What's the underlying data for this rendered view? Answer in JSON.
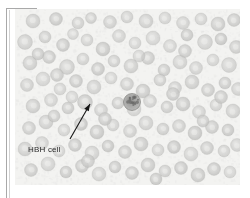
{
  "figure": {
    "kind": "light-microscopy-blood-smear",
    "caption_label": "HBH cell",
    "frame": {
      "bracket_color": "#a9a9a9",
      "secondary_rule_color": "#d2d2d2"
    },
    "plate": {
      "background_color": "#f1f1ef",
      "width_px": 225,
      "height_px": 176,
      "stain_tint": "#cfcfcf"
    },
    "annotation": {
      "label_text": "HBH cell",
      "label_color": "#2b2b2b",
      "arrow_color": "#151515",
      "arrow_tail_x": 55,
      "arrow_tail_y": 130,
      "arrow_head_x": 75,
      "arrow_head_y": 95
    },
    "cells": {
      "erythrocyte_fill": "#c6c6c4",
      "erythrocyte_edge": "#b0b0ae",
      "highlighted_cell_fill": "#9a9a98",
      "count_visible": 118
    }
  },
  "chart_data": {
    "type": "scatter",
    "title": "HBH cell",
    "xlabel": "",
    "ylabel": "",
    "note": "Peripheral blood smear micrograph; circular erythrocytes scattered on pale field. One cell indicated by arrow and labelled 'HBH cell'.",
    "legend": [
      "HBH cell"
    ],
    "series": [
      {
        "name": "erythrocytes",
        "points": [
          [
            18,
            12,
            7.0
          ],
          [
            41,
            10,
            6.5
          ],
          [
            63,
            14,
            6.0
          ],
          [
            76,
            9,
            5.5
          ],
          [
            95,
            13,
            6.5
          ],
          [
            112,
            8,
            6.0
          ],
          [
            131,
            12,
            7.0
          ],
          [
            150,
            9,
            6.0
          ],
          [
            168,
            14,
            6.5
          ],
          [
            186,
            10,
            6.0
          ],
          [
            203,
            15,
            7.0
          ],
          [
            219,
            11,
            6.5
          ],
          [
            10,
            33,
            7.5
          ],
          [
            30,
            28,
            6.0
          ],
          [
            48,
            36,
            6.5
          ],
          [
            58,
            25,
            5.5
          ],
          [
            72,
            31,
            6.0
          ],
          [
            88,
            40,
            7.0
          ],
          [
            104,
            27,
            6.5
          ],
          [
            120,
            34,
            6.0
          ],
          [
            138,
            29,
            7.0
          ],
          [
            155,
            37,
            6.5
          ],
          [
            172,
            26,
            6.0
          ],
          [
            190,
            33,
            7.5
          ],
          [
            206,
            30,
            6.0
          ],
          [
            221,
            38,
            6.5
          ],
          [
            15,
            54,
            7.0
          ],
          [
            34,
            48,
            6.5
          ],
          [
            52,
            58,
            7.5
          ],
          [
            68,
            50,
            6.0
          ],
          [
            83,
            60,
            6.5
          ],
          [
            99,
            52,
            6.0
          ],
          [
            116,
            57,
            7.0
          ],
          [
            133,
            49,
            6.5
          ],
          [
            149,
            61,
            6.0
          ],
          [
            165,
            53,
            7.0
          ],
          [
            181,
            59,
            6.5
          ],
          [
            198,
            51,
            6.0
          ],
          [
            214,
            56,
            7.5
          ],
          [
            12,
            76,
            6.5
          ],
          [
            28,
            70,
            7.0
          ],
          [
            45,
            80,
            6.0
          ],
          [
            61,
            72,
            6.5
          ],
          [
            79,
            78,
            7.0
          ],
          [
            96,
            69,
            6.0
          ],
          [
            112,
            75,
            6.5
          ],
          [
            128,
            82,
            7.0
          ],
          [
            145,
            71,
            6.0
          ],
          [
            160,
            79,
            6.5
          ],
          [
            177,
            73,
            7.0
          ],
          [
            193,
            81,
            6.5
          ],
          [
            210,
            74,
            6.0
          ],
          [
            223,
            80,
            6.5
          ],
          [
            18,
            97,
            7.0
          ],
          [
            36,
            91,
            6.5
          ],
          [
            53,
            99,
            6.0
          ],
          [
            70,
            93,
            7.5
          ],
          [
            86,
            101,
            6.5
          ],
          [
            103,
            94,
            6.0
          ],
          [
            119,
            100,
            7.0
          ],
          [
            135,
            92,
            6.5
          ],
          [
            152,
            98,
            6.0
          ],
          [
            168,
            95,
            7.0
          ],
          [
            184,
            103,
            6.5
          ],
          [
            201,
            96,
            6.0
          ],
          [
            218,
            102,
            7.0
          ],
          [
            14,
            119,
            6.5
          ],
          [
            31,
            113,
            7.0
          ],
          [
            49,
            121,
            6.0
          ],
          [
            66,
            115,
            6.5
          ],
          [
            82,
            123,
            7.0
          ],
          [
            98,
            116,
            6.0
          ],
          [
            115,
            122,
            6.5
          ],
          [
            131,
            114,
            7.0
          ],
          [
            148,
            120,
            6.0
          ],
          [
            164,
            117,
            6.5
          ],
          [
            180,
            124,
            7.0
          ],
          [
            197,
            118,
            6.5
          ],
          [
            213,
            121,
            6.0
          ],
          [
            10,
            140,
            7.0
          ],
          [
            27,
            134,
            6.5
          ],
          [
            44,
            142,
            6.0
          ],
          [
            60,
            136,
            6.5
          ],
          [
            77,
            144,
            7.0
          ],
          [
            93,
            137,
            6.0
          ],
          [
            110,
            143,
            6.5
          ],
          [
            126,
            135,
            7.0
          ],
          [
            143,
            141,
            6.0
          ],
          [
            159,
            138,
            6.5
          ],
          [
            176,
            145,
            7.0
          ],
          [
            192,
            139,
            6.5
          ],
          [
            209,
            142,
            6.0
          ],
          [
            222,
            136,
            6.5
          ],
          [
            16,
            161,
            6.5
          ],
          [
            33,
            155,
            7.0
          ],
          [
            51,
            163,
            6.0
          ],
          [
            67,
            157,
            6.5
          ],
          [
            84,
            165,
            7.0
          ],
          [
            100,
            158,
            6.0
          ],
          [
            117,
            164,
            6.5
          ],
          [
            133,
            156,
            7.0
          ],
          [
            150,
            162,
            6.0
          ],
          [
            166,
            159,
            6.5
          ],
          [
            183,
            166,
            7.0
          ],
          [
            199,
            160,
            6.5
          ],
          [
            215,
            163,
            6.0
          ],
          [
            23,
            45,
            6.0
          ],
          [
            42,
            66,
            6.5
          ],
          [
            57,
            88,
            6.0
          ],
          [
            90,
            110,
            6.5
          ],
          [
            124,
            47,
            6.0
          ],
          [
            158,
            85,
            6.5
          ],
          [
            188,
            112,
            6.0
          ],
          [
            206,
            88,
            6.5
          ],
          [
            39,
            107,
            6.0
          ],
          [
            73,
            152,
            6.5
          ],
          [
            141,
            170,
            6.0
          ],
          [
            170,
            42,
            6.5
          ]
        ]
      },
      {
        "name": "highlighted-hbh-cell",
        "points": [
          [
            117,
            93,
            8.5
          ]
        ]
      }
    ]
  }
}
